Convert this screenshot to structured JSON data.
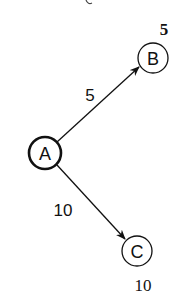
{
  "diagram": {
    "type": "weighted-directed-graph",
    "colors": {
      "stroke": "#111111",
      "background": "#ffffff"
    },
    "nodes": [
      {
        "id": "A",
        "label": "A",
        "cx": 45,
        "cy": 153,
        "r": 16,
        "stroke_width": 2.6,
        "distance": ""
      },
      {
        "id": "B",
        "label": "B",
        "cx": 153,
        "cy": 58,
        "r": 15,
        "stroke_width": 1.3,
        "distance": "5",
        "distance_bold": true
      },
      {
        "id": "C",
        "label": "C",
        "cx": 137,
        "cy": 251,
        "r": 15,
        "stroke_width": 1.3,
        "distance": "10",
        "distance_bold": false
      }
    ],
    "edges": [
      {
        "from": "A",
        "to": "B",
        "weight": "5"
      },
      {
        "from": "A",
        "to": "C",
        "weight": "10"
      }
    ],
    "labels": {
      "node_a": "A",
      "node_b": "B",
      "node_c": "C",
      "edge_ab_weight": "5",
      "edge_ac_weight": "10",
      "dist_b": "5",
      "dist_c": "10"
    }
  }
}
